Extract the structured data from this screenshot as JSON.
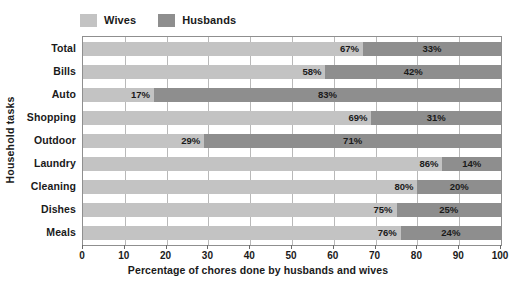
{
  "chart_data": {
    "type": "bar",
    "orientation": "horizontal",
    "stacked": true,
    "stacked_normalized": true,
    "title": "",
    "xlabel": "Percentage of chores done by husbands and wives",
    "ylabel": "Household tasks",
    "xlim": [
      0,
      100
    ],
    "xticks": [
      0,
      10,
      20,
      30,
      40,
      50,
      60,
      70,
      80,
      90,
      100
    ],
    "xtick_labels": [
      "0",
      "10",
      "20",
      "30",
      "40",
      "50",
      "60",
      "70",
      "80",
      "90",
      "100"
    ],
    "grid": true,
    "grid_axis": "x",
    "legend_position": "top-left",
    "categories": [
      "Total",
      "Bills",
      "Auto",
      "Shopping",
      "Outdoor",
      "Laundry",
      "Cleaning",
      "Dishes",
      "Meals"
    ],
    "series": [
      {
        "name": "Wives",
        "color": "#c3c3c3",
        "values": [
          67,
          58,
          17,
          69,
          29,
          86,
          80,
          75,
          76
        ],
        "data_labels": [
          "67%",
          "58%",
          "17%",
          "69%",
          "29%",
          "86%",
          "80%",
          "75%",
          "76%"
        ]
      },
      {
        "name": "Husbands",
        "color": "#8e8e8e",
        "values": [
          33,
          42,
          83,
          31,
          71,
          14,
          20,
          25,
          24
        ],
        "data_labels": [
          "33%",
          "42%",
          "83%",
          "31%",
          "71%",
          "14%",
          "20%",
          "25%",
          "24%"
        ]
      }
    ]
  },
  "legend": {
    "entries": [
      {
        "label": "Wives",
        "color": "#c3c3c3"
      },
      {
        "label": "Husbands",
        "color": "#8e8e8e"
      }
    ]
  },
  "axes": {
    "y_title": "Household tasks",
    "x_title": "Percentage of chores done by husbands and wives"
  },
  "colors": {
    "wives": "#c3c3c3",
    "husbands": "#8e8e8e",
    "plot_border": "#8f8f8f",
    "gridline": "#b9b9b9",
    "text": "#1a1a1a",
    "background": "#ffffff"
  }
}
